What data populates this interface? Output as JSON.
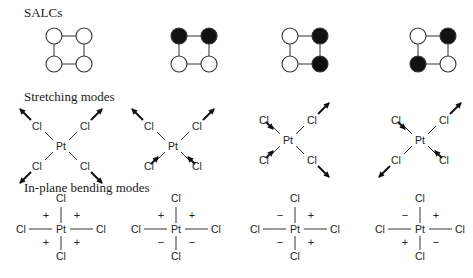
{
  "sections": {
    "salcs": {
      "title": "SALCs",
      "items": [
        {
          "fills": [
            "white",
            "white",
            "white",
            "white"
          ]
        },
        {
          "fills": [
            "black",
            "black",
            "white",
            "white"
          ]
        },
        {
          "fills": [
            "white",
            "black",
            "white",
            "black"
          ]
        },
        {
          "fills": [
            "white",
            "black",
            "black",
            "white"
          ]
        }
      ]
    },
    "stretching": {
      "title": "Stretching modes",
      "central_atom": "Pt",
      "ligand": "Cl",
      "items": [
        {
          "arrows": [
            "out",
            "out",
            "out",
            "out"
          ]
        },
        {
          "arrows": [
            "out",
            "out",
            "in",
            "in"
          ]
        },
        {
          "arrows": [
            "in",
            "out",
            "in",
            "out"
          ]
        },
        {
          "arrows": [
            "in",
            "out",
            "out",
            "in"
          ]
        }
      ],
      "arrow_order": [
        "top-left",
        "top-right",
        "bottom-left",
        "bottom-right"
      ]
    },
    "bending": {
      "title": "In-plane bending modes",
      "central_atom": "Pt",
      "ligand": "Cl",
      "items": [
        {
          "signs": [
            "+",
            "+",
            "+",
            "+"
          ]
        },
        {
          "signs": [
            "+",
            "+",
            "−",
            "−"
          ]
        },
        {
          "signs": [
            "−",
            "+",
            "−",
            "+"
          ]
        },
        {
          "signs": [
            "−",
            "+",
            "+",
            "−"
          ]
        }
      ],
      "sign_order": [
        "top-left",
        "top-right",
        "bottom-left",
        "bottom-right"
      ]
    }
  },
  "colors": {
    "ink": "#1a1a1a",
    "fill_dark": "#111111",
    "fill_light": "#ffffff"
  }
}
